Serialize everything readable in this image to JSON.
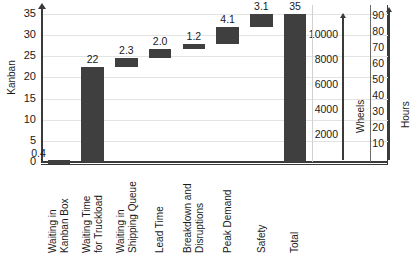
{
  "chart_data": {
    "type": "bar",
    "subtype": "waterfall",
    "title": "",
    "xlabel": "",
    "ylabel": "Kanban",
    "ylim": [
      0,
      35
    ],
    "yticks": [
      0,
      5,
      10,
      15,
      20,
      25,
      30,
      35
    ],
    "grid": true,
    "legend": "none",
    "bar_color": "#3f3f3f",
    "categories": [
      "Waiting in Kanban Box",
      "Waiting Time for Truckload",
      "Waiting in Shipping Queue",
      "Lead Time",
      "Breakdown and Disruptions",
      "Peak Demand",
      "Safety",
      "Total"
    ],
    "category_lines": [
      [
        "Waiting in",
        "Kanban Box"
      ],
      [
        "Waiting Time",
        "for Truckload"
      ],
      [
        "Waiting in",
        "Shipping Queue"
      ],
      [
        "Lead Time"
      ],
      [
        "Breakdown and",
        "Disruptions"
      ],
      [
        "Peak Demand"
      ],
      [
        "Safety"
      ],
      [
        "Total"
      ]
    ],
    "values": [
      0.4,
      22,
      2.3,
      2.0,
      1.2,
      4.1,
      3.1,
      35
    ],
    "value_labels": [
      "0.4",
      "22",
      "2.3",
      "2.0",
      "1.2",
      "4.1",
      "3.1",
      "35"
    ],
    "bar_base": [
      0,
      0,
      22.4,
      24.7,
      26.7,
      27.9,
      32.0,
      0
    ],
    "bar_top": [
      0.4,
      22.4,
      24.7,
      26.7,
      27.9,
      32.0,
      35.1,
      35
    ],
    "is_total": [
      false,
      false,
      false,
      false,
      false,
      false,
      false,
      true
    ],
    "secondary_axes": [
      {
        "name": "Wheels",
        "title": "Wheels",
        "ticks": [
          2000,
          4000,
          6000,
          8000,
          10000
        ],
        "tick_labels": [
          "2000",
          "4000",
          "6000",
          "8000",
          "10000"
        ],
        "lim": [
          0,
          11000
        ]
      },
      {
        "name": "Hours",
        "title": "Hours",
        "ticks": [
          10,
          20,
          30,
          40,
          50,
          60,
          70,
          80,
          90
        ],
        "tick_labels": [
          "10",
          "20",
          "30",
          "40",
          "50",
          "60",
          "70",
          "80",
          "90"
        ],
        "lim": [
          0,
          90
        ]
      }
    ]
  }
}
